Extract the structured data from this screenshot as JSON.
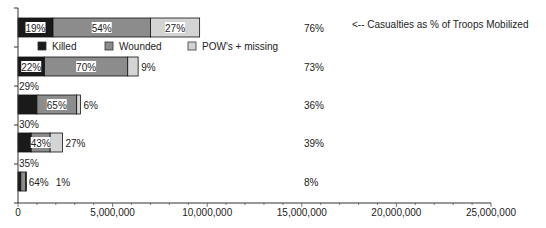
{
  "chart_data": {
    "type": "bar",
    "orientation": "horizontal",
    "stacked": true,
    "title": "",
    "xlabel": "",
    "ylabel": "",
    "xlim": [
      0,
      25000000
    ],
    "xticks": [
      0,
      5000000,
      10000000,
      15000000,
      20000000,
      25000000
    ],
    "xtick_labels": [
      "0",
      "5,000,000",
      "10,000,000",
      "15,000,000",
      "20,000,000",
      "25,000,000"
    ],
    "grid": false,
    "legend": {
      "placement": "top-center",
      "entries": [
        {
          "name": "Killed",
          "color": "#1a1a1a"
        },
        {
          "name": "Wounded",
          "color": "#8c8c8c"
        },
        {
          "name": "POW's + missing",
          "color": "#d4d4d4"
        }
      ]
    },
    "categories": [
      "Bar 1",
      "Bar 2",
      "Bar 3",
      "Bar 4",
      "Bar 5"
    ],
    "series": [
      {
        "name": "Killed",
        "color": "#1a1a1a",
        "values": [
          1850000,
          1400000,
          1000000,
          700000,
          150000
        ],
        "pct_labels": [
          "19%",
          "22%",
          "29%",
          "30%",
          "35%"
        ]
      },
      {
        "name": "Wounded",
        "color": "#8c8c8c",
        "values": [
          5150000,
          4400000,
          2100000,
          1000000,
          250000
        ],
        "pct_labels": [
          "54%",
          "70%",
          "65%",
          "43%",
          "64%"
        ]
      },
      {
        "name": "POW's + missing",
        "color": "#d4d4d4",
        "values": [
          2600000,
          550000,
          200000,
          650000,
          10000
        ],
        "pct_labels": [
          "27%",
          "9%",
          "6%",
          "27%",
          "1%"
        ]
      }
    ],
    "casualty_rates": [
      "76%",
      "73%",
      "36%",
      "39%",
      "8%"
    ],
    "annotation": "<-- Casualties as % of Troops Mobilized"
  }
}
